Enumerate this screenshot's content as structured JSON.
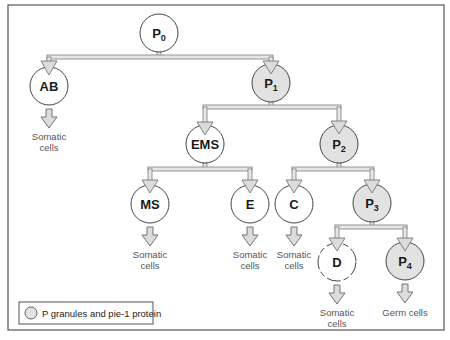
{
  "colors": {
    "frame": "#555555",
    "node_outline": "#444444",
    "node_fill_plain": "#ffffff",
    "node_fill_pgranule": "#e2e2e2",
    "pipe_outline": "#8a8a8a",
    "pipe_fill": "#e6e6e6",
    "arrow_fill": "#dcdcdc"
  },
  "nodes": {
    "P0": {
      "base": "P",
      "sub": "0",
      "granules": false
    },
    "AB": {
      "label": "AB",
      "granules": false
    },
    "P1": {
      "base": "P",
      "sub": "1",
      "granules": true
    },
    "EMS": {
      "label": "EMS",
      "granules": false
    },
    "P2": {
      "base": "P",
      "sub": "2",
      "granules": true
    },
    "MS": {
      "label": "MS",
      "granules": false
    },
    "E": {
      "label": "E",
      "granules": false
    },
    "C": {
      "label": "C",
      "granules": false
    },
    "P3": {
      "base": "P",
      "sub": "3",
      "granules": true
    },
    "D": {
      "label": "D",
      "granules": false
    },
    "P4": {
      "base": "P",
      "sub": "4",
      "granules": true
    }
  },
  "fates": {
    "AB": [
      "Somatic",
      "cells"
    ],
    "MS": [
      "Somatic",
      "cells"
    ],
    "E": [
      "Somatic",
      "cells"
    ],
    "C": [
      "Somatic",
      "cells"
    ],
    "D": [
      "Somatic",
      "cells"
    ],
    "P4": [
      "Germ cells"
    ]
  },
  "legend": {
    "label": "P granules and pie-1 protein"
  }
}
